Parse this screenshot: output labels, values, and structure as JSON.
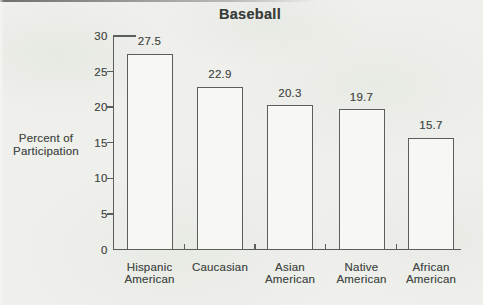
{
  "chart_data": {
    "type": "bar",
    "title": "Baseball",
    "categories": [
      "Hispanic American",
      "Caucasian",
      "Asian American",
      "Native American",
      "African American"
    ],
    "category_lines": [
      [
        "Hispanic",
        "American"
      ],
      [
        "Caucasian"
      ],
      [
        "Asian",
        "American"
      ],
      [
        "Native",
        "American"
      ],
      [
        "African",
        "American"
      ]
    ],
    "values": [
      27.5,
      22.9,
      20.3,
      19.7,
      15.7
    ],
    "value_labels": [
      "27.5",
      "22.9",
      "20.3",
      "19.7",
      "15.7"
    ],
    "xlabel": "",
    "ylabel": "Percent of Participation",
    "ylabel_lines": [
      "Percent of",
      "Participation"
    ],
    "ylim": [
      0,
      30
    ],
    "yticks": [
      0,
      5,
      10,
      15,
      20,
      25,
      30
    ],
    "grid": false,
    "legend": false,
    "bar_fill": "#f7f8f4",
    "line_color": "#5a5f5b",
    "text_color": "#454a47"
  }
}
